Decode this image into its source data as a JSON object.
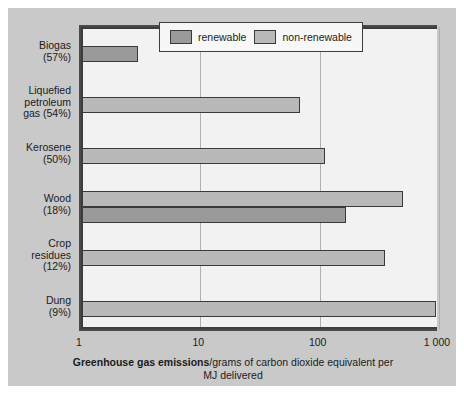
{
  "chart_data": {
    "type": "bar",
    "orientation": "horizontal",
    "title": "",
    "xlabel_bold": "Greenhouse gas emissions",
    "xlabel_rest": "/grams of carbon dioxide equivalent per MJ delivered",
    "xlabel_full": "Greenhouse gas emissions/grams of carbon dioxide equivalent per MJ delivered",
    "ylabel": "",
    "xscale": "log",
    "xlim": [
      1,
      1000
    ],
    "xticks": [
      1,
      10,
      100,
      1000
    ],
    "xticklabels": [
      "1",
      "10",
      "100",
      "1 000"
    ],
    "grid": "vertical",
    "legend_position": "top-center",
    "categories": [
      "Biogas (57%)",
      "Liquefied petroleum gas (54%)",
      "Kerosene (50%)",
      "Wood (18%)",
      "Crop residues (12%)",
      "Dung (9%)"
    ],
    "series": [
      {
        "name": "renewable",
        "color": "#9a9a9a",
        "values": [
          3,
          null,
          null,
          165,
          null,
          null
        ]
      },
      {
        "name": "non-renewable",
        "color": "#b9b9b9",
        "values": [
          null,
          68,
          110,
          500,
          350,
          950
        ]
      }
    ],
    "bars": [
      {
        "category": "Biogas (57%)",
        "series": "renewable",
        "value": 3
      },
      {
        "category": "Liquefied petroleum gas (54%)",
        "series": "non-renewable",
        "value": 68
      },
      {
        "category": "Kerosene (50%)",
        "series": "non-renewable",
        "value": 110
      },
      {
        "category": "Wood (18%)",
        "series": "non-renewable",
        "value": 500
      },
      {
        "category": "Wood (18%)",
        "series": "renewable",
        "value": 165
      },
      {
        "category": "Crop residues (12%)",
        "series": "non-renewable",
        "value": 350
      },
      {
        "category": "Dung (9%)",
        "series": "non-renewable",
        "value": 950
      }
    ]
  },
  "legend": {
    "entries": [
      {
        "label": "renewable",
        "color": "#9a9a9a"
      },
      {
        "label": "non-renewable",
        "color": "#b9b9b9"
      }
    ]
  },
  "categories": [
    {
      "line1": "Biogas",
      "line2": "(57%)",
      "line3": ""
    },
    {
      "line1": "Liquefied",
      "line2": "petroleum",
      "line3": "gas (54%)"
    },
    {
      "line1": "Kerosene",
      "line2": "(50%)",
      "line3": ""
    },
    {
      "line1": "Wood",
      "line2": "(18%)",
      "line3": ""
    },
    {
      "line1": "Crop",
      "line2": "residues",
      "line3": "(12%)"
    },
    {
      "line1": "Dung",
      "line2": "(9%)",
      "line3": ""
    }
  ],
  "ticks": [
    {
      "label": "1"
    },
    {
      "label": "10"
    },
    {
      "label": "100"
    },
    {
      "label": "1 000"
    }
  ],
  "colors": {
    "panel_background": "#c9c9c9",
    "plot_background": "#f2f2f2",
    "axis": "#3d3d3d",
    "gridline": "#b0b0b0",
    "renewable": "#9a9a9a",
    "non_renewable": "#b9b9b9",
    "text": "#1b1b1b"
  }
}
